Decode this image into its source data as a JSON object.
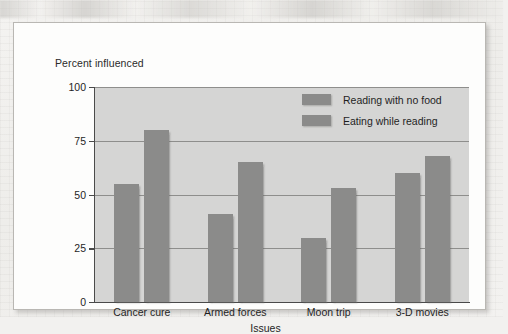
{
  "chart_data": {
    "type": "bar",
    "title": "",
    "xlabel": "Issues",
    "ylabel": "Percent influenced",
    "categories": [
      "Cancer cure",
      "Armed forces",
      "Moon trip",
      "3-D movies"
    ],
    "series": [
      {
        "name": "Reading with no food",
        "values": [
          55,
          41,
          30,
          60
        ],
        "color": "#8b8b8a"
      },
      {
        "name": "Eating while reading",
        "values": [
          80,
          65,
          53,
          68
        ],
        "color": "#8b8b8a"
      }
    ],
    "ylim": [
      0,
      100
    ],
    "yticks": [
      0,
      25,
      50,
      75,
      100
    ],
    "ytick_labels": [
      "0",
      "25",
      "50",
      "75",
      "100"
    ],
    "grid": true,
    "legend_position": "top-right",
    "plot_background": "#d5d5d4"
  },
  "axis": {
    "y_title": "Percent influenced",
    "x_title": "Issues"
  },
  "legend": {
    "entries": [
      {
        "label": "Reading with no food"
      },
      {
        "label": "Eating while reading"
      }
    ]
  },
  "colors": {
    "bar": "#8b8b8a",
    "plot_bg": "#d5d5d4",
    "gridline": "#8e8e8c",
    "axis": "#4a4a4a",
    "card_bg": "#fdfdfc",
    "page_bg": "#f2f1ef"
  }
}
